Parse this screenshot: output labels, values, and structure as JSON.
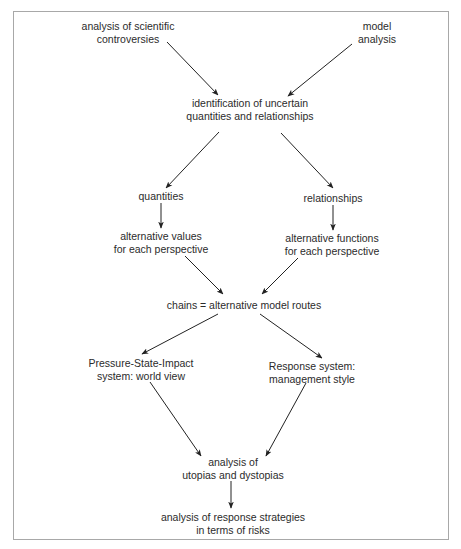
{
  "diagram": {
    "type": "flowchart",
    "nodes": [
      {
        "id": "scientific_controversies",
        "lines": [
          "analysis of scientific",
          "controversies"
        ]
      },
      {
        "id": "model_analysis",
        "lines": [
          "model",
          "analysis"
        ]
      },
      {
        "id": "identification",
        "lines": [
          "identification of uncertain",
          "quantities and relationships"
        ]
      },
      {
        "id": "quantities",
        "lines": [
          "quantities"
        ]
      },
      {
        "id": "relationships",
        "lines": [
          "relationships"
        ]
      },
      {
        "id": "alt_values",
        "lines": [
          "alternative values",
          "for each perspective"
        ]
      },
      {
        "id": "alt_functions",
        "lines": [
          "alternative functions",
          "for each perspective"
        ]
      },
      {
        "id": "chains",
        "lines": [
          "chains = alternative model routes"
        ]
      },
      {
        "id": "psi_system",
        "lines": [
          "Pressure-State-Impact",
          "system: world view"
        ]
      },
      {
        "id": "response_system",
        "lines": [
          "Response system:",
          "management style"
        ]
      },
      {
        "id": "utopias",
        "lines": [
          "analysis of",
          "utopias and dystopias"
        ]
      },
      {
        "id": "response_strategies",
        "lines": [
          "analysis of response strategies",
          "in terms of risks"
        ]
      }
    ],
    "edges": [
      {
        "from": "scientific_controversies",
        "to": "identification"
      },
      {
        "from": "model_analysis",
        "to": "identification"
      },
      {
        "from": "identification",
        "to": "quantities"
      },
      {
        "from": "identification",
        "to": "relationships"
      },
      {
        "from": "quantities",
        "to": "alt_values"
      },
      {
        "from": "relationships",
        "to": "alt_functions"
      },
      {
        "from": "alt_values",
        "to": "chains"
      },
      {
        "from": "alt_functions",
        "to": "chains"
      },
      {
        "from": "chains",
        "to": "psi_system"
      },
      {
        "from": "chains",
        "to": "response_system"
      },
      {
        "from": "psi_system",
        "to": "utopias"
      },
      {
        "from": "response_system",
        "to": "utopias"
      },
      {
        "from": "utopias",
        "to": "response_strategies"
      }
    ],
    "colors": {
      "text": "#2b2b2b",
      "arrow": "#222222",
      "frame": "#a8a8a8"
    }
  }
}
